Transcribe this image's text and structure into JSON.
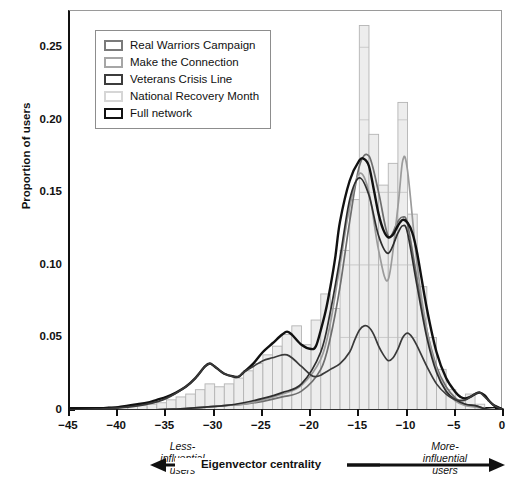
{
  "axes": {
    "y_title": "Proportion of users",
    "y_ticks": [
      "0.25",
      "0.20",
      "0.15",
      "0.10",
      "0.05",
      "0"
    ],
    "x_ticks": [
      "−45",
      "−40",
      "−35",
      "−30",
      "−25",
      "−20",
      "−15",
      "−10",
      "−5",
      "0"
    ]
  },
  "legend": {
    "items": [
      {
        "label": "Real Warriors Campaign",
        "swatch_border": "#7a7a7a",
        "swatch_fill": "#ffffff"
      },
      {
        "label": "Make the Connection",
        "swatch_border": "#a6a6a6",
        "swatch_fill": "#ffffff"
      },
      {
        "label": "Veterans Crisis Line",
        "swatch_border": "#3c3c3c",
        "swatch_fill": "#ffffff"
      },
      {
        "label": "National Recovery Month",
        "swatch_border": "#d6d6d6",
        "swatch_fill": "#ffffff"
      },
      {
        "label": "Full network",
        "swatch_border": "#111111",
        "swatch_fill": "#ffffff"
      }
    ]
  },
  "caption": {
    "left_line1": "Less-",
    "left_line2": "influential",
    "left_line3": "users",
    "center": "Eigenvector centrality",
    "right_line1": "More-",
    "right_line2": "influential",
    "right_line3": "users"
  },
  "chart_data": {
    "type": "histogram",
    "title": "",
    "xlabel": "Eigenvector centrality",
    "ylabel": "Proportion of users",
    "xlim": [
      -45,
      0
    ],
    "ylim": [
      0,
      0.275
    ],
    "bin_width": 1,
    "grid": false,
    "legend_position": "top-left",
    "annotations": [
      "Less-influential users (left arrow)",
      "More-influential users (right arrow)"
    ],
    "histogram": {
      "name": "National Recovery Month",
      "fill": "#ededed",
      "edge": "#b4b4b4",
      "bin_centers": [
        -42.5,
        -41.5,
        -40.5,
        -39.5,
        -38.5,
        -37.5,
        -36.5,
        -35.5,
        -34.5,
        -33.5,
        -32.5,
        -31.5,
        -30.5,
        -29.5,
        -28.5,
        -27.5,
        -26.5,
        -25.5,
        -24.5,
        -23.5,
        -22.5,
        -21.5,
        -20.5,
        -19.5,
        -18.5,
        -17.5,
        -16.5,
        -15.5,
        -14.5,
        -13.5,
        -12.5,
        -11.5,
        -10.5,
        -9.5,
        -8.5,
        -7.5,
        -6.5,
        -5.5,
        -4.5,
        -3.5,
        -2.5,
        -1.5,
        -0.5
      ],
      "values": [
        0.001,
        0.001,
        0.002,
        0.002,
        0.003,
        0.003,
        0.004,
        0.005,
        0.007,
        0.009,
        0.011,
        0.014,
        0.018,
        0.016,
        0.018,
        0.022,
        0.027,
        0.032,
        0.038,
        0.044,
        0.052,
        0.058,
        0.045,
        0.062,
        0.08,
        0.07,
        0.11,
        0.145,
        0.265,
        0.19,
        0.155,
        0.17,
        0.212,
        0.135,
        0.085,
        0.05,
        0.028,
        0.014,
        0.006,
        0.011,
        0.004,
        0.001,
        0.0
      ]
    },
    "series": [
      {
        "name": "Real Warriors Campaign",
        "color": "#6e6e6e",
        "type": "density",
        "x": [
          -45,
          -43,
          -41,
          -39,
          -37,
          -35,
          -33,
          -31,
          -29,
          -27,
          -25,
          -23,
          -21,
          -19,
          -18,
          -17,
          -16,
          -15,
          -14,
          -13,
          -12,
          -11,
          -10.5,
          -10,
          -9,
          -8,
          -7,
          -6,
          -5,
          -4,
          -3,
          -2,
          -1,
          0
        ],
        "y": [
          0.0,
          0.0,
          0.0,
          0.0,
          0.0,
          0.0005,
          0.001,
          0.002,
          0.003,
          0.004,
          0.006,
          0.009,
          0.013,
          0.028,
          0.05,
          0.085,
          0.13,
          0.168,
          0.175,
          0.15,
          0.12,
          0.13,
          0.133,
          0.128,
          0.09,
          0.055,
          0.03,
          0.016,
          0.008,
          0.004,
          0.003,
          0.001,
          0.0,
          0.0
        ]
      },
      {
        "name": "Make the Connection",
        "color": "#9b9b9b",
        "type": "density",
        "x": [
          -45,
          -43,
          -41,
          -39,
          -37,
          -35,
          -33,
          -31,
          -29,
          -27,
          -25,
          -23,
          -21,
          -19,
          -18,
          -17,
          -16,
          -15,
          -14,
          -13,
          -12,
          -11,
          -10.5,
          -10,
          -9,
          -8,
          -7,
          -6,
          -5,
          -4,
          -3,
          -2,
          -1,
          0
        ],
        "y": [
          0.0,
          0.0,
          0.0,
          0.0,
          0.0,
          0.0005,
          0.001,
          0.002,
          0.003,
          0.004,
          0.007,
          0.011,
          0.017,
          0.035,
          0.06,
          0.1,
          0.14,
          0.163,
          0.15,
          0.11,
          0.09,
          0.14,
          0.172,
          0.165,
          0.1,
          0.055,
          0.028,
          0.013,
          0.006,
          0.003,
          0.002,
          0.001,
          0.0,
          0.0
        ]
      },
      {
        "name": "Veterans Crisis Line",
        "color": "#2e2e2e",
        "type": "density",
        "x": [
          -45,
          -43,
          -41,
          -39,
          -37,
          -35,
          -33,
          -31,
          -29,
          -27,
          -25,
          -23,
          -21,
          -19,
          -18,
          -17,
          -16,
          -15,
          -14,
          -13,
          -12,
          -11,
          -10.5,
          -10,
          -9,
          -8,
          -7,
          -6,
          -5,
          -4,
          -3,
          -2,
          -1,
          0
        ],
        "y": [
          0.0,
          0.0,
          0.0,
          0.0,
          0.0,
          0.0005,
          0.001,
          0.002,
          0.003,
          0.005,
          0.008,
          0.012,
          0.018,
          0.04,
          0.068,
          0.105,
          0.145,
          0.16,
          0.148,
          0.12,
          0.108,
          0.122,
          0.127,
          0.122,
          0.085,
          0.05,
          0.026,
          0.013,
          0.007,
          0.004,
          0.003,
          0.001,
          0.0,
          0.0
        ]
      },
      {
        "name": "Full network",
        "color": "#111111",
        "type": "density",
        "x": [
          -45,
          -44,
          -43,
          -42,
          -41,
          -40,
          -39,
          -38,
          -37,
          -36,
          -35,
          -34,
          -33,
          -32,
          -31,
          -30.5,
          -30,
          -29,
          -28,
          -27.5,
          -27,
          -26,
          -25,
          -24,
          -23,
          -22.5,
          -22,
          -21,
          -20,
          -19.5,
          -19,
          -18.5,
          -18,
          -17.5,
          -17,
          -16,
          -15,
          -14.5,
          -14,
          -13.5,
          -13,
          -12.5,
          -12,
          -11.5,
          -11,
          -10.5,
          -10,
          -9.5,
          -9,
          -8,
          -7,
          -6,
          -5,
          -4.5,
          -4,
          -3.5,
          -3,
          -2.5,
          -2,
          -1.5,
          -1,
          0
        ],
        "y": [
          0.0,
          0.0,
          0.0005,
          0.001,
          0.0015,
          0.002,
          0.003,
          0.004,
          0.005,
          0.007,
          0.009,
          0.012,
          0.016,
          0.022,
          0.03,
          0.032,
          0.03,
          0.025,
          0.023,
          0.023,
          0.026,
          0.032,
          0.04,
          0.046,
          0.052,
          0.054,
          0.052,
          0.045,
          0.042,
          0.044,
          0.055,
          0.068,
          0.085,
          0.105,
          0.13,
          0.158,
          0.172,
          0.173,
          0.168,
          0.152,
          0.135,
          0.124,
          0.119,
          0.121,
          0.127,
          0.131,
          0.129,
          0.122,
          0.108,
          0.07,
          0.04,
          0.022,
          0.012,
          0.009,
          0.008,
          0.009,
          0.011,
          0.012,
          0.01,
          0.006,
          0.003,
          0.0
        ]
      },
      {
        "name": "Full network secondary",
        "color": "#3a3a3a",
        "type": "density",
        "x": [
          -45,
          -43,
          -41,
          -39,
          -37,
          -35,
          -33,
          -32,
          -31,
          -30.5,
          -30,
          -29,
          -28,
          -27.5,
          -27,
          -26,
          -25,
          -24,
          -23,
          -22.5,
          -22,
          -21,
          -20,
          -19.5,
          -19,
          -18.5,
          -18,
          -17,
          -16,
          -15.5,
          -15,
          -14.5,
          -14,
          -13.5,
          -13,
          -12.5,
          -12,
          -11.5,
          -11,
          -10.5,
          -10,
          -9.5,
          -9,
          -8,
          -7,
          -6,
          -5,
          -4,
          -3.5,
          -3,
          -2.5,
          -2,
          -1,
          0
        ],
        "y": [
          0.0,
          0.0005,
          0.001,
          0.002,
          0.004,
          0.008,
          0.016,
          0.022,
          0.03,
          0.032,
          0.03,
          0.025,
          0.023,
          0.023,
          0.026,
          0.03,
          0.034,
          0.036,
          0.038,
          0.038,
          0.036,
          0.03,
          0.024,
          0.023,
          0.024,
          0.026,
          0.028,
          0.032,
          0.04,
          0.048,
          0.055,
          0.058,
          0.057,
          0.052,
          0.044,
          0.038,
          0.034,
          0.036,
          0.042,
          0.05,
          0.053,
          0.05,
          0.044,
          0.03,
          0.018,
          0.011,
          0.007,
          0.007,
          0.009,
          0.011,
          0.012,
          0.009,
          0.003,
          0.0
        ]
      }
    ]
  }
}
